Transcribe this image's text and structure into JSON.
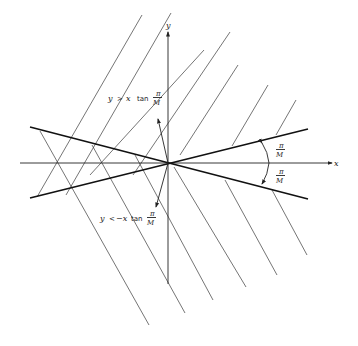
{
  "diagram": {
    "axes": {
      "x_label": "x",
      "y_label": "y"
    },
    "annotations": {
      "upper_region": {
        "lhs": "y",
        "rel": ">",
        "rhs_var": "x",
        "fn": "tan",
        "num": "π",
        "den": "M"
      },
      "lower_region": {
        "lhs": "y",
        "rel": "<",
        "rhs_var": "−x",
        "fn": "tan",
        "num": "π",
        "den": "M"
      },
      "angle_upper": {
        "num": "π",
        "den": "M"
      },
      "angle_lower": {
        "num": "π",
        "den": "M"
      }
    }
  }
}
